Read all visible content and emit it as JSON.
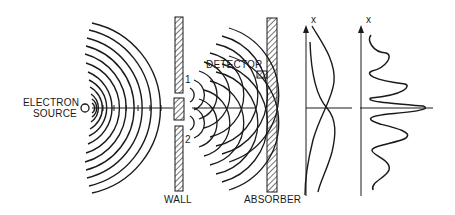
{
  "diagram": {
    "labels": {
      "source_line1": "ELECTRON",
      "source_line2": "SOURCE",
      "wall": "WALL",
      "absorber": "ABSORBER",
      "detector": "DETECTOR",
      "slit1": "1",
      "slit2": "2"
    },
    "axes": {
      "individual_plot_axis": "x",
      "interference_plot_axis": "x"
    },
    "plots": {
      "individual": {
        "description": "Two single-slit probability curves P1 and P2 crossing at center",
        "curves": [
          "P1",
          "P2"
        ]
      },
      "interference": {
        "description": "Interference pattern P12 with central peak and side fringes",
        "peaks": 5
      }
    },
    "colors": {
      "ink": "#1a1a1a",
      "background": "#ffffff"
    }
  }
}
